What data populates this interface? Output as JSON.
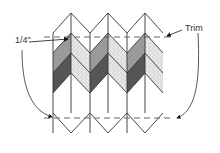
{
  "labels": {
    "seam_allowance": "1/4\"",
    "trim": "Trim"
  },
  "colors": {
    "outline": "#333333",
    "medium_gray": "#9a9a9a",
    "dark_gray": "#555555",
    "speckled_base": "#e6e6e6",
    "speckle": "#888888",
    "white": "#ffffff",
    "dashed_line": "#555555"
  },
  "pattern": {
    "type": "chevron-strip-pieced",
    "columns": 5,
    "bands": [
      "white",
      "medium_gray/speckled",
      "dark_gray/speckled",
      "white"
    ],
    "trim_lines": 2
  }
}
